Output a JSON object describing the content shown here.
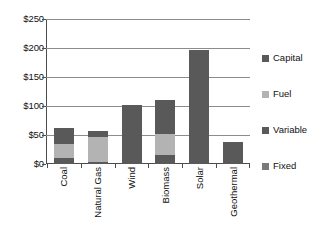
{
  "chart_data": {
    "type": "bar",
    "title": "",
    "subtitle": "",
    "xlabel": "",
    "ylabel": "",
    "stacked": true,
    "grid": true,
    "legend_position": "right",
    "ylim": [
      0,
      250
    ],
    "yticks": [
      0,
      50,
      100,
      150,
      200,
      250
    ],
    "ytick_labels": [
      "$0",
      "$50",
      "$100",
      "$150",
      "$200",
      "$250"
    ],
    "categories": [
      "Coal",
      "Natural Gas",
      "Wind",
      "Biomass",
      "Solar",
      "Geothermal"
    ],
    "series": [
      {
        "name": "Capital",
        "color": "#595959",
        "values": [
          27,
          11,
          101,
          58,
          196,
          38
        ]
      },
      {
        "name": "Fuel",
        "color": "#b3b3b3",
        "values": [
          25,
          43,
          0,
          37,
          0,
          0
        ]
      },
      {
        "name": "Variable",
        "color": "#595959",
        "values": [
          10,
          3,
          0,
          15,
          0,
          0
        ]
      },
      {
        "name": "Fixed",
        "color": "#7a7a7a",
        "values": [
          0,
          0,
          0,
          0,
          0,
          0
        ]
      }
    ],
    "totals": [
      62,
      57,
      101,
      110,
      196,
      38
    ]
  },
  "axis": {
    "yticks": [
      {
        "label": "$250",
        "value": 250
      },
      {
        "label": "$200",
        "value": 200
      },
      {
        "label": "$150",
        "value": 150
      },
      {
        "label": "$100",
        "value": 100
      },
      {
        "label": "$50",
        "value": 50
      },
      {
        "label": "$0",
        "value": 0
      }
    ]
  },
  "legend": {
    "items": [
      {
        "label": "Capital",
        "color": "#595959"
      },
      {
        "label": "Fuel",
        "color": "#b3b3b3"
      },
      {
        "label": "Variable",
        "color": "#595959"
      },
      {
        "label": "Fixed",
        "color": "#7a7a7a"
      }
    ]
  }
}
